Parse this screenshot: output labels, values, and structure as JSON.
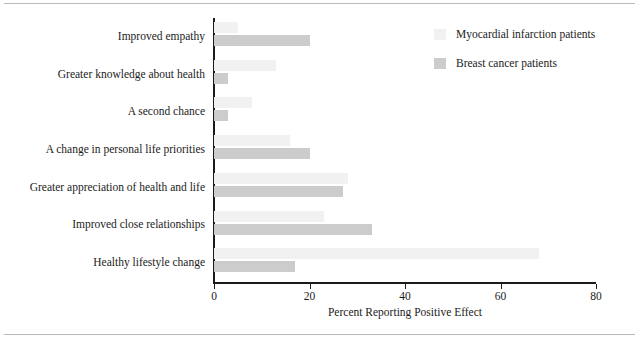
{
  "chart_data": {
    "type": "bar",
    "orientation": "horizontal",
    "title": "",
    "subtitle": "",
    "xlabel": "Percent Reporting Positive Effect",
    "ylabel": "",
    "xlim": [
      0,
      80
    ],
    "xticks": [
      0,
      20,
      40,
      60,
      80
    ],
    "xtick_labels": [
      "0",
      "20",
      "40",
      "60",
      "80"
    ],
    "grid": false,
    "legend_position": "top-right",
    "categories": [
      "Improved empathy",
      "Greater knowledge about health",
      "A second chance",
      "A change in personal life priorities",
      "Greater appreciation of health and life",
      "Improved close relationships",
      "Healthy lifestyle change"
    ],
    "series": [
      {
        "name": "Myocardial infarction patients",
        "color": "#f1f1f1",
        "values": [
          5,
          13,
          8,
          16,
          28,
          23,
          68
        ]
      },
      {
        "name": "Breast cancer patients",
        "color": "#cccccc",
        "values": [
          20,
          3,
          3,
          20,
          27,
          33,
          17
        ]
      }
    ],
    "annotations": []
  },
  "axis": {
    "axis_color": "#1b1b1b",
    "value_axis_title": "Percent Reporting Positive Effect"
  },
  "legend": {
    "items": [
      {
        "label": "Myocardial infarction patients",
        "color": "#f1f1f1"
      },
      {
        "label": "Breast cancer patients",
        "color": "#cccccc"
      }
    ]
  }
}
